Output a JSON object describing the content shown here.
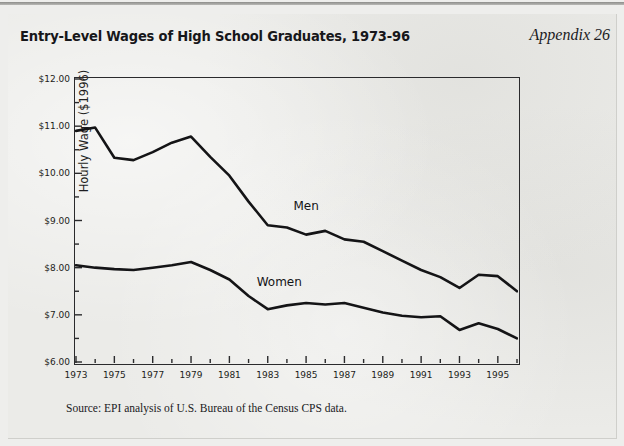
{
  "header": {
    "title": "Entry-Level Wages of High School Graduates, 1973-96",
    "appendix": "Appendix 26"
  },
  "source_note": "Source: EPI analysis of U.S. Bureau of the Census CPS data.",
  "chart_data": {
    "type": "line",
    "title": "Entry-Level Wages of High School Graduates, 1973-96",
    "xlabel": "",
    "ylabel": "Hourly Wage ($1996)",
    "xlim": [
      1973,
      1996
    ],
    "ylim": [
      6.0,
      12.0
    ],
    "y_major_step": 1.0,
    "y_minor_step": 0.5,
    "grid": false,
    "legend": "inline-annotations",
    "x": [
      1973,
      1974,
      1975,
      1976,
      1977,
      1978,
      1979,
      1980,
      1981,
      1982,
      1983,
      1984,
      1985,
      1986,
      1987,
      1988,
      1989,
      1990,
      1991,
      1992,
      1993,
      1994,
      1995,
      1996
    ],
    "xtick_labels": [
      "1973",
      "1975",
      "1977",
      "1979",
      "1981",
      "1983",
      "1985",
      "1987",
      "1989",
      "1991",
      "1993",
      "1995"
    ],
    "xtick_values": [
      1973,
      1975,
      1977,
      1979,
      1981,
      1983,
      1985,
      1987,
      1989,
      1991,
      1993,
      1995
    ],
    "ytick_labels": [
      "$12.00",
      "$11.00",
      "$10.00",
      "$9.00",
      "$8.00",
      "$7.00",
      "$6.00"
    ],
    "ytick_values": [
      12.0,
      11.0,
      10.0,
      9.0,
      8.0,
      7.0,
      6.0
    ],
    "series": [
      {
        "name": "Men",
        "label_x": 1985.0,
        "label_y": 9.3,
        "values": [
          10.9,
          10.97,
          10.33,
          10.28,
          10.45,
          10.65,
          10.78,
          10.35,
          9.95,
          9.4,
          8.9,
          8.85,
          8.7,
          8.78,
          8.6,
          8.55,
          8.35,
          8.15,
          7.95,
          7.8,
          7.57,
          7.85,
          7.82,
          7.5
        ]
      },
      {
        "name": "Women",
        "label_x": 1983.6,
        "label_y": 7.7,
        "values": [
          8.05,
          8.0,
          7.97,
          7.95,
          8.0,
          8.05,
          8.12,
          7.95,
          7.75,
          7.4,
          7.12,
          7.2,
          7.25,
          7.22,
          7.25,
          7.15,
          7.05,
          6.98,
          6.95,
          6.97,
          6.68,
          6.82,
          6.7,
          6.5
        ]
      }
    ]
  }
}
